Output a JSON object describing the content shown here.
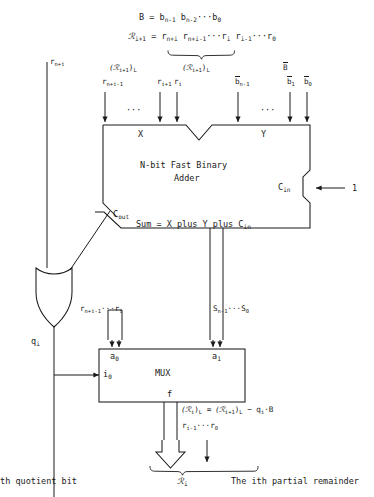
{
  "diagram": {
    "equations": {
      "divisor_def_lhs": "B",
      "divisor_def_eq": "=",
      "divisor_def_rhs_1": "b",
      "divisor_def_sub_1": "n-1",
      "divisor_def_rhs_2": "b",
      "divisor_def_sub_2": "n-2",
      "divisor_def_dots": "···",
      "divisor_def_rhs_3": "b",
      "divisor_def_sub_3": "0",
      "remainder_def_lhs": "ℛ",
      "remainder_def_lhs_sub": "i+1",
      "remainder_def_eq": "=",
      "remainder_def_r1": "r",
      "remainder_def_r1_sub": "n+i",
      "remainder_def_r2": "r",
      "remainder_def_r2_sub": "n+i-1",
      "remainder_def_dots1": "···",
      "remainder_def_r3": "r",
      "remainder_def_r3_sub": "i",
      "remainder_def_r4": "r",
      "remainder_def_r4_sub": "i-1",
      "remainder_def_dots2": "···",
      "remainder_def_r5": "r",
      "remainder_def_r5_sub": "0"
    },
    "labels": {
      "rni": "r",
      "rni_sub": "n+i",
      "group_left": "(ℛ",
      "group_left_sub": "i+1",
      "group_left_close": ")",
      "group_left_close_sub": "L",
      "group_mid": "(ℛ",
      "group_mid_sub": "i+1",
      "group_mid_close": ")",
      "group_mid_close_sub": "L",
      "group_b": "B",
      "x_bit_1": "r",
      "x_bit_1_sub": "n+i-1",
      "x_bit_2": "r",
      "x_bit_2_sub": "i+1",
      "x_bit_3": "r",
      "x_bit_3_sub": "i",
      "y_bit_1": "b",
      "y_bit_1_sub": "n-1",
      "y_bit_2": "b",
      "y_bit_2_sub": "1",
      "y_bit_3": "b",
      "y_bit_3_sub": "0",
      "ellipsis": "···",
      "port_x": "X",
      "port_y": "Y",
      "adder_line1": "N-bit Fast Binary",
      "adder_line2": "Adder",
      "cin": "C",
      "cin_sub": "in",
      "cin_value": "1",
      "cout": "C",
      "cout_sub": "out",
      "sum_expr": "Sum = X plus Y plus C",
      "sum_expr_sub": "in",
      "qi": "q",
      "qi_sub": "i",
      "mux_a0_bus": "r",
      "mux_a0_bus_sub": "n+i-1",
      "mux_a0_bus_dots": "···",
      "mux_a0_bus_2": "r",
      "mux_a0_bus_2_sub": "i",
      "sum_bus": "S",
      "sum_bus_sub": "n-1",
      "sum_bus_dots": "···",
      "sum_bus_2": "S",
      "sum_bus_2_sub": "0",
      "mux_a0": "a",
      "mux_a0_sub": "0",
      "mux_a1": "a",
      "mux_a1_sub": "1",
      "mux_i0": "i",
      "mux_i0_sub": "0",
      "mux_name": "MUX",
      "mux_f": "f",
      "out_eq_l1_a": "(ℛ",
      "out_eq_l1_a_sub": "i",
      "out_eq_l1_b": ")",
      "out_eq_l1_b_sub": "L",
      "out_eq_l1_eq": "=",
      "out_eq_l1_c": "(ℛ",
      "out_eq_l1_c_sub": "i+1",
      "out_eq_l1_d": ")",
      "out_eq_l1_d_sub": "L",
      "out_eq_l1_minus": "−",
      "out_eq_l1_q": "q",
      "out_eq_l1_q_sub": "i",
      "out_eq_l1_dot": "·B",
      "out_eq_l2_a": "r",
      "out_eq_l2_a_sub": "i-1",
      "out_eq_l2_dots": "···",
      "out_eq_l2_b": "r",
      "out_eq_l2_b_sub": "0",
      "result_r": "ℛ",
      "result_r_sub": "i",
      "caption_left": "ith quotient bit",
      "caption_right": "The ith partial remainder"
    },
    "colors": {
      "ink": "#1a1a1a",
      "background": "#ffffff"
    }
  }
}
